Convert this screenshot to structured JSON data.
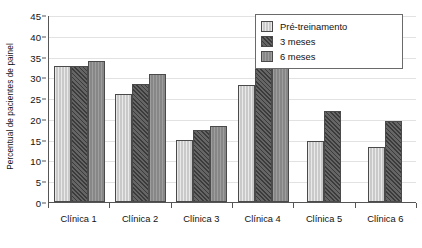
{
  "chart_data": {
    "type": "bar",
    "title": "",
    "xlabel": "",
    "ylabel": "Percentual de pacientes de painel",
    "ylim": [
      0,
      45
    ],
    "ytick_step": 5,
    "yticks": [
      0,
      5,
      10,
      15,
      20,
      25,
      30,
      35,
      40,
      45
    ],
    "grid": true,
    "legend_position": "top-right",
    "categories": [
      "Clínica 1",
      "Clínica 2",
      "Clínica 3",
      "Clínica 4",
      "Clínica 5",
      "Clínica 6"
    ],
    "series": [
      {
        "name": "Pré-treinamento",
        "color": "#cfcfcf",
        "values": [
          32.8,
          25.9,
          14.9,
          28.1,
          14.8,
          13.2
        ]
      },
      {
        "name": "3 meses",
        "color": "#545454",
        "values": [
          32.8,
          28.5,
          17.3,
          34.8,
          22.0,
          19.5
        ]
      },
      {
        "name": "6 meses",
        "color": "#8e8e8e",
        "values": [
          34.0,
          30.9,
          18.4,
          38.4,
          null,
          null
        ]
      }
    ]
  },
  "axis": {
    "y_title": "Percentual de pacientes de painel"
  },
  "legend": {
    "items": [
      {
        "label": "Pré-treinamento"
      },
      {
        "label": "3 meses"
      },
      {
        "label": "6 meses"
      }
    ]
  }
}
